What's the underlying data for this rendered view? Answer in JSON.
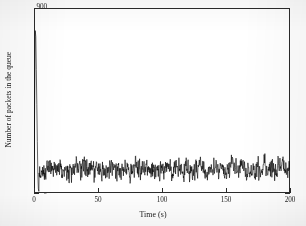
{
  "chart_data": {
    "type": "line",
    "title": "",
    "xlabel": "Time (s)",
    "ylabel": "Number of packets in the queue",
    "xlim": [
      0,
      200
    ],
    "ylim": [
      0,
      900
    ],
    "xticks": [
      0,
      50,
      100,
      150,
      200
    ],
    "xtick_labels": [
      "0",
      "50",
      "100",
      "150",
      "200"
    ],
    "yticks": [
      0,
      100,
      200,
      300,
      400,
      500,
      600,
      700,
      800,
      900
    ],
    "ytick_labels": [
      "0",
      "100",
      "200",
      "300",
      "400",
      "500",
      "600",
      "700",
      "800",
      "900"
    ],
    "grid": false,
    "legend": null,
    "line_color": "#000000",
    "background_color": "#ffffff",
    "frame_color": "#2b2b2b",
    "series": [
      {
        "name": "queue length",
        "description": "Initial transient spike to about 790 packets near t=1 s, collapsing to near zero by t=3 s, followed by a dense stationary noise band for the rest of the run.",
        "transient": {
          "x": [
            0,
            0.5,
            1.0,
            1.4,
            1.8,
            2.2,
            2.6,
            3.0,
            3.4,
            3.8
          ],
          "y": [
            0,
            420,
            790,
            760,
            600,
            430,
            250,
            90,
            20,
            8
          ]
        },
        "steady_state": {
          "x_start": 4,
          "x_end": 200,
          "mean": 115,
          "min": 45,
          "max": 195,
          "samples": 900
        }
      }
    ]
  },
  "axes": {
    "y_title": "Number of packets in the queue",
    "x_title": "Time (s)"
  }
}
